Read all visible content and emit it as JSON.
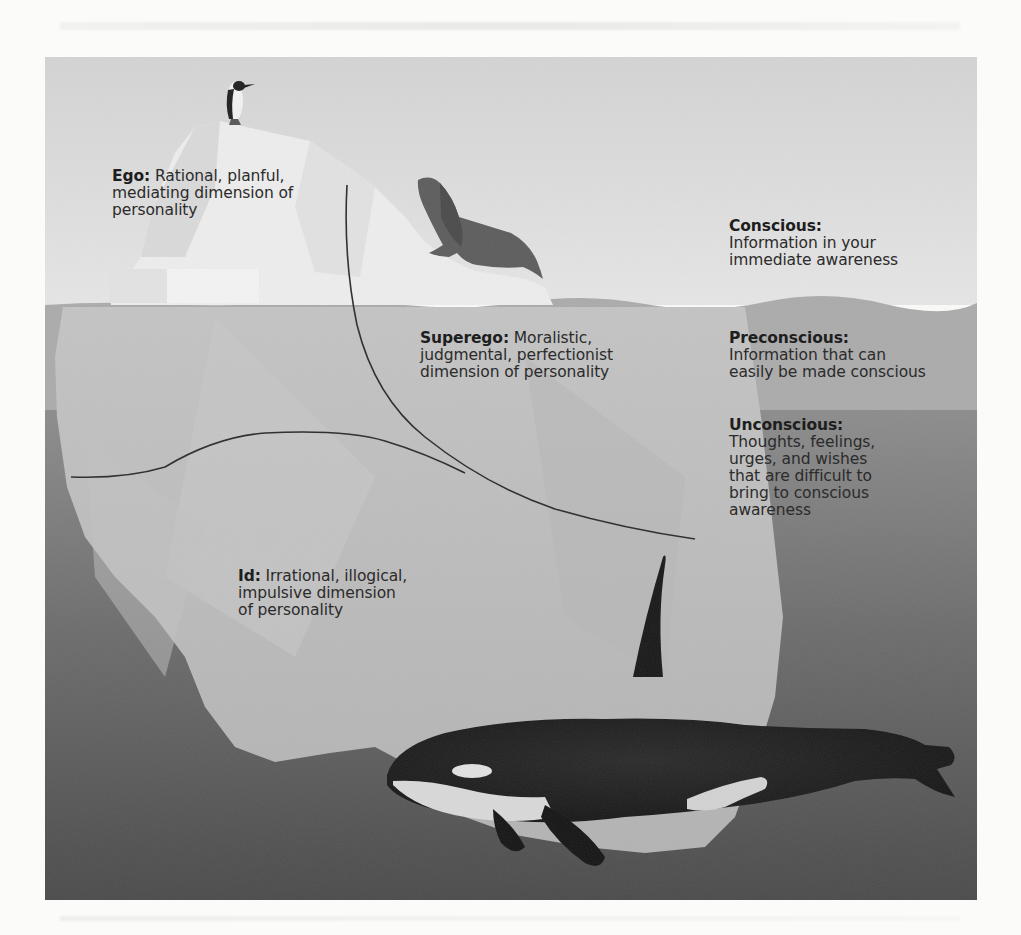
{
  "figure": {
    "type": "iceberg-model-of-mind",
    "colors": {
      "sky": "#dcdcdc",
      "water_preconscious": "#a9a9a9",
      "water_unconscious": "#8e8e8e",
      "water_deep": "#555555",
      "ice_above": "#efefef",
      "ice_below": "#bdbdbd",
      "orca_black": "#1b1b1b",
      "orca_white": "#d8d8d8",
      "seal": "#5a5a5a",
      "divider_line": "#2a2a2a",
      "text": "#2b2b2b"
    }
  },
  "personality_structures": [
    {
      "id": "ego",
      "term": "Ego:",
      "description": "Rational, planful, mediating dimension of personality",
      "lines": [
        "Rational, planful,",
        "mediating dimension of",
        "personality"
      ]
    },
    {
      "id": "superego",
      "term": "Superego:",
      "description": "Moralistic, judgmental, perfectionist dimension of personality",
      "lines": [
        "Moralistic,",
        "judgmental, perfectionist",
        "dimension of personality"
      ]
    },
    {
      "id": "id",
      "term": "Id:",
      "description": "Irrational, illogical, impulsive dimension of personality",
      "lines": [
        "Irrational, illogical,",
        "impulsive dimension",
        "of personality"
      ]
    }
  ],
  "levels_of_awareness": [
    {
      "id": "conscious",
      "term": "Conscious:",
      "lines": [
        "Information in your",
        "immediate awareness"
      ]
    },
    {
      "id": "preconscious",
      "term": "Preconscious:",
      "lines": [
        "Information that can",
        "easily be made conscious"
      ]
    },
    {
      "id": "unconscious",
      "term": "Unconscious:",
      "lines": [
        "Thoughts, feelings,",
        "urges, and wishes",
        "that are difficult to",
        "bring to conscious",
        "awareness"
      ]
    }
  ],
  "illustrations": [
    "penguin",
    "fur-seal",
    "orca",
    "iceberg"
  ]
}
